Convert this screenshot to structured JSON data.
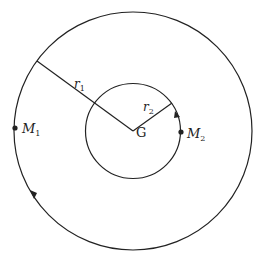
{
  "diagram": {
    "type": "orbit",
    "center_label": "G",
    "outer_orbit": {
      "radius_label": "r",
      "radius_sub": "1",
      "body_label": "M",
      "body_sub": "1"
    },
    "inner_orbit": {
      "radius_label": "r",
      "radius_sub": "2",
      "body_label": "M",
      "body_sub": "2"
    },
    "stroke_color": "#222222"
  }
}
